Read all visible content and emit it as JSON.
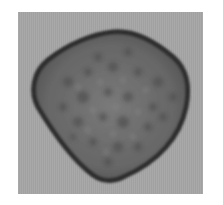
{
  "image": {
    "subject": "pollen grain micrograph",
    "background_color": "#ffffff",
    "frame_color": "#a6a6a6",
    "grain_fill_color": "#6a6a6a",
    "grain_edge_color": "#2e2e2e"
  }
}
